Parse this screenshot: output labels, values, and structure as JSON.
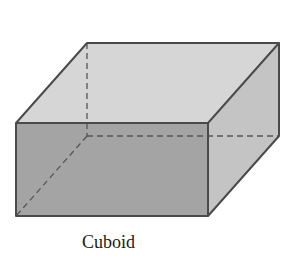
{
  "figure": {
    "caption": "Cuboid",
    "shape": "cuboid",
    "colors": {
      "background": "#ffffff",
      "top_face": "#d6d6d6",
      "front_face": "#a4a4a4",
      "side_face": "#c4c4c4",
      "edge": "#4a4a4a",
      "hidden_edge": "#555555"
    },
    "vertices": {
      "front_top_left": [
        16,
        123
      ],
      "front_top_right": [
        208,
        123
      ],
      "front_bottom_left": [
        16,
        216
      ],
      "front_bottom_right": [
        208,
        216
      ],
      "back_top_left": [
        87,
        43
      ],
      "back_top_right": [
        279,
        43
      ],
      "back_bottom_left": [
        87,
        136
      ],
      "back_bottom_right": [
        279,
        136
      ]
    }
  }
}
